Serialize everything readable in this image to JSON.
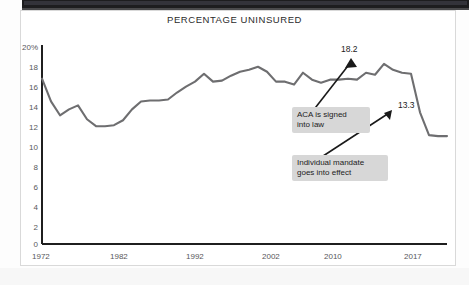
{
  "figure": {
    "title": "PERCENTAGE UNINSURED"
  },
  "annotations": {
    "aca": "ACA is signed\ninto law",
    "mandate": "Individual mandate\ngoes into effect",
    "peak_value_label": "18.2",
    "mandate_value_label": "13.3"
  },
  "colors": {
    "line": "#6e6e70",
    "axis": "#1f1f1f",
    "note_background": "#d7d7d7",
    "tick_text": "#57575a",
    "frame": "#d9d9d9",
    "top_bar": "#1d1d1f"
  },
  "chart_data": {
    "type": "line",
    "title": "PERCENTAGE UNINSURED",
    "xlabel": "",
    "ylabel": "",
    "xlim": [
      1972,
      2017
    ],
    "ylim": [
      0,
      20
    ],
    "grid": false,
    "legend": null,
    "ytick_labels": [
      "20%",
      "18",
      "16",
      "14",
      "12",
      "10",
      "8",
      "6",
      "4",
      "2",
      "0"
    ],
    "ytick_values": [
      20,
      18,
      16,
      14,
      12,
      10,
      8,
      6,
      4,
      2,
      0
    ],
    "xtick_labels": [
      "1972",
      "1982",
      "1992",
      "2002",
      "2010",
      "2017"
    ],
    "xtick_values": [
      1972,
      1982,
      1992,
      2002,
      2010,
      2017
    ],
    "series": [
      {
        "name": "Percentage uninsured",
        "x": [
          1972,
          1973,
          1974,
          1975,
          1976,
          1977,
          1978,
          1979,
          1980,
          1981,
          1982,
          1983,
          1984,
          1985,
          1986,
          1987,
          1988,
          1989,
          1990,
          1991,
          1992,
          1993,
          1994,
          1995,
          1996,
          1997,
          1998,
          1999,
          2000,
          2001,
          2002,
          2003,
          2004,
          2005,
          2006,
          2007,
          2008,
          2009,
          2010,
          2011,
          2012,
          2013,
          2014,
          2015,
          2016,
          2017
        ],
        "values": [
          16.7,
          14.4,
          13.0,
          13.6,
          14.0,
          12.6,
          11.9,
          11.9,
          12.0,
          12.5,
          13.6,
          14.4,
          14.5,
          14.5,
          14.6,
          15.3,
          15.9,
          16.4,
          17.2,
          16.4,
          16.5,
          17.0,
          17.4,
          17.6,
          17.9,
          17.4,
          16.4,
          16.4,
          16.1,
          17.3,
          16.6,
          16.3,
          16.6,
          16.6,
          16.7,
          16.6,
          17.3,
          17.1,
          18.2,
          17.6,
          17.3,
          17.2,
          13.3,
          11.0,
          10.9,
          10.9
        ],
        "color": "#6e6e70"
      }
    ],
    "point_annotations": [
      {
        "label": "18.2",
        "x": 2010,
        "y": 18.2,
        "note": "ACA is signed into law"
      },
      {
        "label": "13.3",
        "x": 2014,
        "y": 13.3,
        "note": "Individual mandate goes into effect"
      }
    ]
  }
}
